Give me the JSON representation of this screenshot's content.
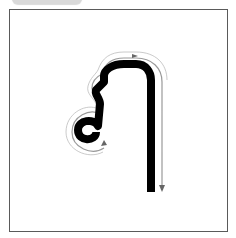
{
  "card": {
    "type": "stroke-order practice card",
    "glyph_description": "single-stroke letter: loop at lower-left, rising stem, arch across top, long right descender",
    "guide": {
      "style": "outlined guide path with direction arrows",
      "arrows": [
        "top-arch",
        "right-descender-down",
        "loop-exit"
      ]
    }
  },
  "colors": {
    "stroke": "#000000",
    "guide": "#808080",
    "frame": "#5a5a5a",
    "tab": "#d9d9d9",
    "background": "#ffffff"
  }
}
